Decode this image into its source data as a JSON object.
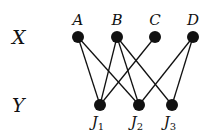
{
  "partitions": {
    "top": {
      "label": "X",
      "nodes": [
        {
          "id": "A",
          "label": "A"
        },
        {
          "id": "B",
          "label": "B"
        },
        {
          "id": "C",
          "label": "C"
        },
        {
          "id": "D",
          "label": "D"
        }
      ]
    },
    "bottom": {
      "label": "Y",
      "nodes": [
        {
          "id": "J1",
          "label": "J",
          "sub": "1"
        },
        {
          "id": "J2",
          "label": "J",
          "sub": "2"
        },
        {
          "id": "J3",
          "label": "J",
          "sub": "3"
        }
      ]
    }
  },
  "edges": [
    [
      "A",
      "J1"
    ],
    [
      "A",
      "J2"
    ],
    [
      "B",
      "J1"
    ],
    [
      "B",
      "J2"
    ],
    [
      "B",
      "J3"
    ],
    [
      "C",
      "J1"
    ],
    [
      "D",
      "J2"
    ],
    [
      "D",
      "J3"
    ]
  ],
  "colors": {
    "ink": "#111111",
    "background": "#ffffff"
  }
}
